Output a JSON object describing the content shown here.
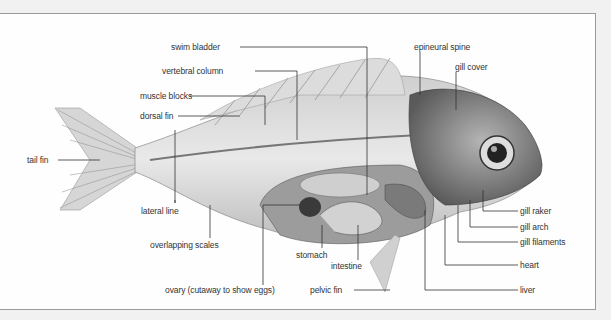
{
  "diagram": {
    "labels": [
      {
        "id": "swim-bladder",
        "text": "swim bladder",
        "x": 171,
        "y": 43
      },
      {
        "id": "vertebral-column",
        "text": "vertebral column",
        "x": 162,
        "y": 67
      },
      {
        "id": "muscle-blocks",
        "text": "muscle blocks",
        "x": 140,
        "y": 91
      },
      {
        "id": "dorsal-fin",
        "text": "dorsal fin",
        "x": 140,
        "y": 112
      },
      {
        "id": "tail-fin",
        "text": "tail fin",
        "x": 27,
        "y": 156
      },
      {
        "id": "lateral-line",
        "text": "lateral line",
        "x": 141,
        "y": 207
      },
      {
        "id": "overlapping-scales",
        "text": "overlapping scales",
        "x": 150,
        "y": 241
      },
      {
        "id": "stomach",
        "text": "stomach",
        "x": 296,
        "y": 252
      },
      {
        "id": "intestine",
        "text": "intestine",
        "x": 331,
        "y": 263
      },
      {
        "id": "ovary",
        "text": "ovary (cutaway to show eggs)",
        "x": 165,
        "y": 286
      },
      {
        "id": "pelvic-fin",
        "text": "pelvic fin",
        "x": 310,
        "y": 286
      },
      {
        "id": "epineural-spine",
        "text": "epineural spine",
        "x": 414,
        "y": 43
      },
      {
        "id": "gill-cover",
        "text": "gill cover",
        "x": 455,
        "y": 63
      },
      {
        "id": "gill-raker",
        "text": "gill raker",
        "x": 520,
        "y": 207
      },
      {
        "id": "gill-arch",
        "text": "gill arch",
        "x": 520,
        "y": 223
      },
      {
        "id": "gill-filaments",
        "text": "gill filaments",
        "x": 520,
        "y": 238
      },
      {
        "id": "heart",
        "text": "heart",
        "x": 520,
        "y": 261
      },
      {
        "id": "liver",
        "text": "liver",
        "x": 520,
        "y": 286
      }
    ]
  }
}
